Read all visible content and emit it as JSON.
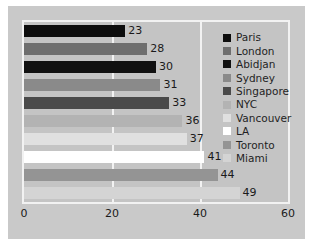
{
  "chart_data": {
    "type": "bar",
    "orientation": "horizontal",
    "title": "",
    "xlabel": "",
    "ylabel": "",
    "xlim": [
      0,
      60
    ],
    "xticks": [
      "0",
      "20",
      "40",
      "60"
    ],
    "xtick_values": [
      0,
      20,
      40,
      60
    ],
    "gridlines": [
      20,
      40
    ],
    "grid": true,
    "legend_position": "right-inside",
    "categories": [
      "Paris",
      "London",
      "Abidjan",
      "Sydney",
      "Singapore",
      "NYC",
      "Vancouver",
      "LA",
      "Toronto",
      "Miami"
    ],
    "values": [
      23,
      28,
      30,
      31,
      33,
      36,
      37,
      41,
      44,
      49
    ],
    "data_labels": [
      "23",
      "28",
      "30",
      "31",
      "33",
      "36",
      "37",
      "41",
      "44",
      "49"
    ],
    "series": [
      {
        "name": "Paris",
        "value": 23,
        "label": "23",
        "color": "#0d0d0d"
      },
      {
        "name": "London",
        "value": 28,
        "label": "28",
        "color": "#6e6e6e"
      },
      {
        "name": "Abidjan",
        "value": 30,
        "label": "30",
        "color": "#111111"
      },
      {
        "name": "Sydney",
        "value": 31,
        "label": "31",
        "color": "#8a8a8a"
      },
      {
        "name": "Singapore",
        "value": 33,
        "label": "33",
        "color": "#4a4a4a"
      },
      {
        "name": "NYC",
        "value": 36,
        "label": "36",
        "color": "#b3b3b3"
      },
      {
        "name": "Vancouver",
        "value": 37,
        "label": "37",
        "color": "#e0e0e0"
      },
      {
        "name": "LA",
        "value": 41,
        "label": "41",
        "color": "#ffffff"
      },
      {
        "name": "Toronto",
        "value": 44,
        "label": "44",
        "color": "#949494"
      },
      {
        "name": "Miami",
        "value": 49,
        "label": "49",
        "color": "#d4d4d4"
      }
    ]
  },
  "legend": {
    "items": [
      {
        "label": "Paris",
        "color": "#0d0d0d"
      },
      {
        "label": "London",
        "color": "#6e6e6e"
      },
      {
        "label": "Abidjan",
        "color": "#111111"
      },
      {
        "label": "Sydney",
        "color": "#8a8a8a"
      },
      {
        "label": "Singapore",
        "color": "#4a4a4a"
      },
      {
        "label": "NYC",
        "color": "#b3b3b3"
      },
      {
        "label": "Vancouver",
        "color": "#e0e0e0"
      },
      {
        "label": "LA",
        "color": "#ffffff"
      },
      {
        "label": "Toronto",
        "color": "#949494"
      },
      {
        "label": "Miami",
        "color": "#d4d4d4"
      }
    ]
  },
  "style": {
    "figure_background": "#c9c9c9",
    "plot_background": "#c4c4c4",
    "axis_color": "#f2f2f2",
    "grid_color": "#f2f2f2",
    "text_color": "#1a1a1a"
  }
}
